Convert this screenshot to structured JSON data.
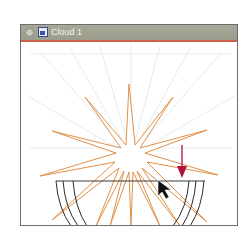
{
  "window": {
    "title": "Cloud 1",
    "close_icon": "close-circle-icon",
    "document_icon": "document-icon"
  },
  "artwork": {
    "star_center": [
      131,
      156
    ],
    "star_stroke_color": "#e0904a",
    "arc_stroke_color": "#2a2a2a",
    "guide_stroke_color": "#ececec",
    "arrow_color": "#b0143c",
    "cursor": "selection-arrow-cursor"
  }
}
